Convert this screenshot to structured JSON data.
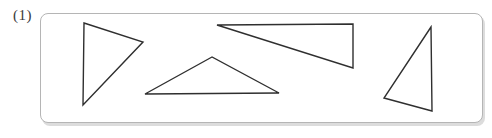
{
  "figure": {
    "label": "(1)",
    "box": {
      "stroke": "#b5b5b5",
      "fill": "#ffffff",
      "shadow": "#dcdcdc"
    },
    "shape_stroke": "#2f2f2f",
    "triangles": [
      {
        "name": "triangle-1",
        "points": [
          [
            84,
            23
          ],
          [
            143,
            42
          ],
          [
            83,
            105
          ]
        ]
      },
      {
        "name": "triangle-2",
        "points": [
          [
            212,
            57
          ],
          [
            145,
            94
          ],
          [
            279,
            93
          ]
        ]
      },
      {
        "name": "triangle-3",
        "points": [
          [
            217,
            25
          ],
          [
            353,
            24
          ],
          [
            353,
            68
          ]
        ]
      },
      {
        "name": "triangle-4",
        "points": [
          [
            431,
            27
          ],
          [
            384,
            98
          ],
          [
            432,
            111
          ]
        ]
      }
    ]
  }
}
